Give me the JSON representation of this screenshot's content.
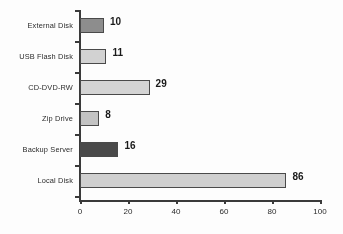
{
  "chart_data": {
    "type": "bar",
    "orientation": "horizontal",
    "title": "",
    "subtitle": "",
    "xlabel": "",
    "ylabel": "",
    "categories": [
      "External Disk",
      "USB Flash Disk",
      "CD-DVD-RW",
      "Zip Drive",
      "Backup Server",
      "Local Disk"
    ],
    "values": [
      10,
      11,
      29,
      8,
      16,
      86
    ],
    "value_labels": [
      "10",
      "11",
      "29",
      "8",
      "16",
      "86"
    ],
    "bar_colors": [
      "#8d8d8d",
      "#d2d2d2",
      "#d4d4d4",
      "#c3c3c3",
      "#4a4a4a",
      "#cfcfcf"
    ],
    "bar_border_color": "#4a4a4a",
    "xlim": [
      0,
      100
    ],
    "xticks": [
      0,
      20,
      40,
      60,
      80,
      100
    ],
    "xtick_labels": [
      "0",
      "20",
      "40",
      "60",
      "80",
      "100"
    ],
    "grid": false,
    "legend": false,
    "axis_color": "#3a3a3a"
  }
}
